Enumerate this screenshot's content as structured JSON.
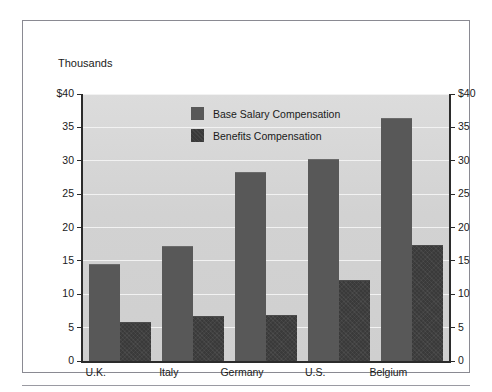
{
  "figure": {
    "title": "Thousands"
  },
  "chart_data": {
    "type": "bar",
    "title": "Thousands",
    "xlabel": "",
    "ylabel": "Thousands",
    "ylim": [
      0,
      40
    ],
    "grid": true,
    "legend_position": "inside-top-center",
    "categories": [
      "U.K.",
      "Italy",
      "Germany",
      "U.S.",
      "Belgium"
    ],
    "y_ticks": [
      0,
      5,
      10,
      15,
      20,
      25,
      30,
      35,
      40
    ],
    "y_tick_labels_left": [
      "0",
      "5",
      "10",
      "15",
      "20",
      "25",
      "30",
      "35",
      "$40"
    ],
    "y_tick_labels_right": [
      "0",
      "5",
      "10",
      "15",
      "20",
      "25",
      "30",
      "35",
      "$40"
    ],
    "series": [
      {
        "name": "Base Salary Compensation",
        "color": "#585858",
        "values": [
          14.6,
          17.2,
          28.3,
          30.2,
          36.4
        ]
      },
      {
        "name": "Benefits Compensation",
        "color": "#3a3a3a",
        "values": [
          5.9,
          6.8,
          6.9,
          12.2,
          17.4
        ]
      }
    ]
  },
  "colors": {
    "plot_background": "#d3d3d3",
    "gridline": "#f2f2f2",
    "axis": "#2b2b2b",
    "frame": "#8a8a92",
    "base_series": "#585858",
    "benefits_series": "#3a3a3a"
  }
}
